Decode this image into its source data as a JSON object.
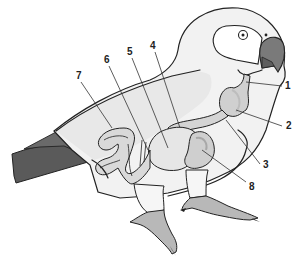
{
  "diagram": {
    "colors": {
      "background": "#ffffff",
      "body": "#f2f2f2",
      "organ": "#d9d9d9",
      "organ_dark": "#bdbdbd",
      "tail": "#5a5a5a",
      "beak": "#7a7a7a",
      "feet": "#b8b8b8",
      "outline": "#222222"
    },
    "labels": [
      {
        "id": "1",
        "text": "1",
        "x": 285,
        "y": 81
      },
      {
        "id": "2",
        "text": "2",
        "x": 286,
        "y": 121
      },
      {
        "id": "3",
        "text": "3",
        "x": 263,
        "y": 160
      },
      {
        "id": "4",
        "text": "4",
        "x": 150,
        "y": 41
      },
      {
        "id": "5",
        "text": "5",
        "x": 127,
        "y": 47
      },
      {
        "id": "6",
        "text": "6",
        "x": 104,
        "y": 55
      },
      {
        "id": "7",
        "text": "7",
        "x": 76,
        "y": 71
      },
      {
        "id": "8",
        "text": "8",
        "x": 249,
        "y": 182
      }
    ]
  }
}
